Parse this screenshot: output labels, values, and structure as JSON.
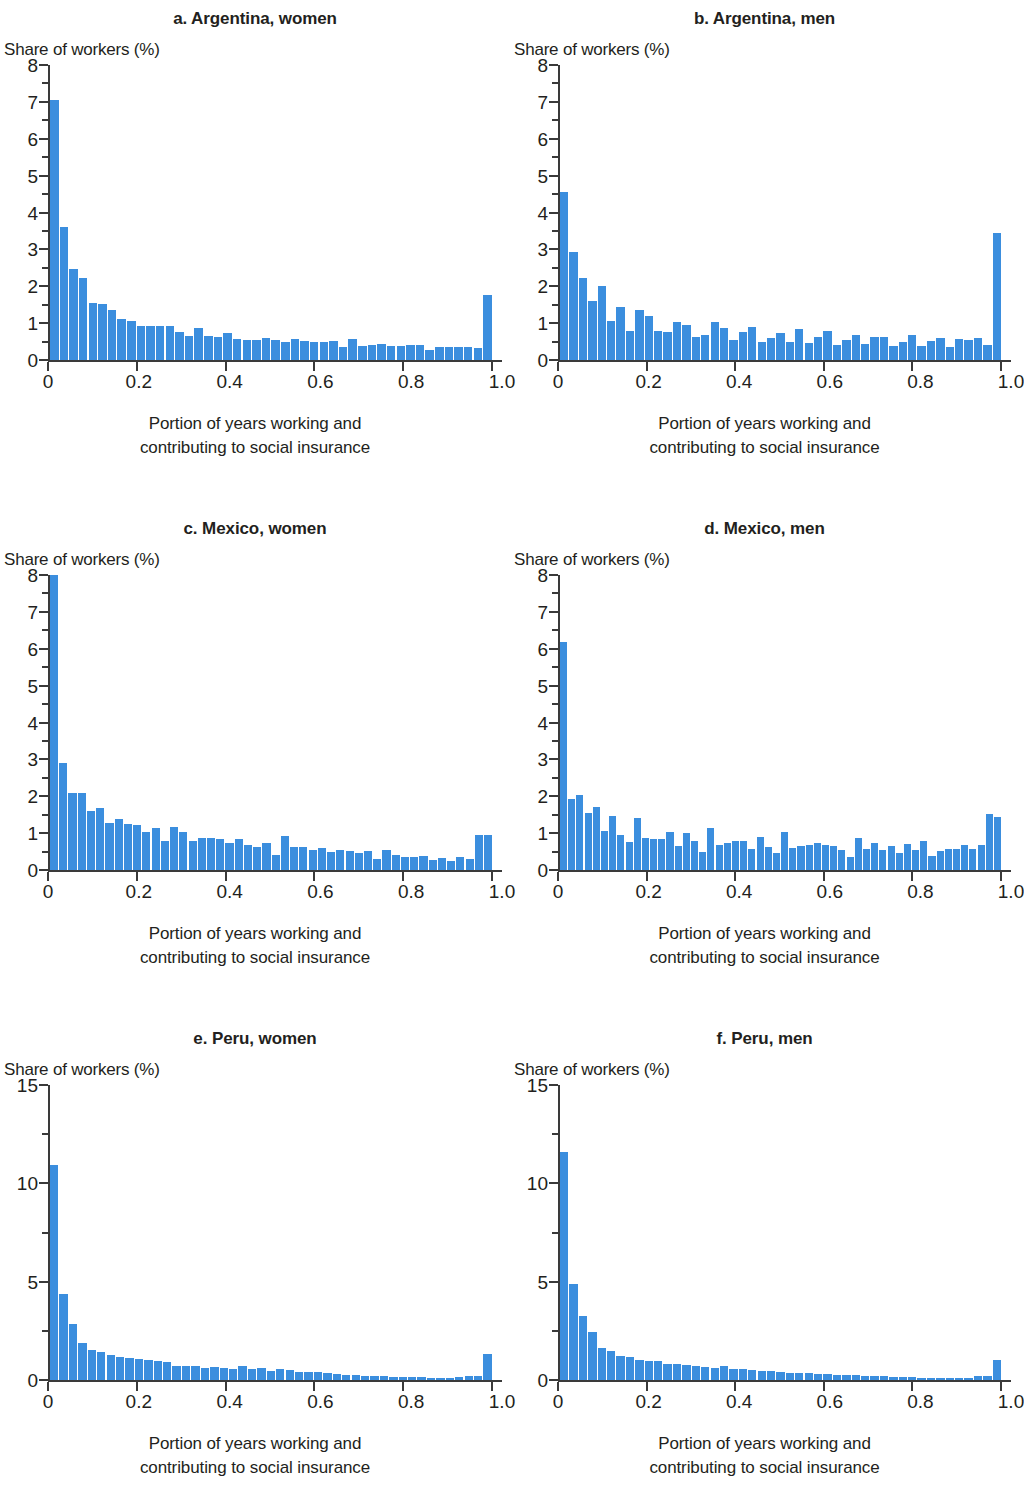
{
  "figure": {
    "ylabel": "Share of workers (%)",
    "xlabel_line1": "Portion of years working and",
    "xlabel_line2": "contributing to social insurance",
    "bar_color": "#3b8ede",
    "axis_color": "#3a3a3a",
    "text_color": "#231f20"
  },
  "chart_data": [
    {
      "type": "bar",
      "panel": "a",
      "title": "a. Argentina, women",
      "xlabel": "Portion of years working and contributing to social insurance",
      "ylabel": "Share of workers (%)",
      "ylim": [
        0,
        8
      ],
      "xlim": [
        0,
        1.0
      ],
      "yticks": [
        0,
        1,
        2,
        3,
        4,
        5,
        6,
        7,
        8
      ],
      "ytick_labels": [
        "0",
        "1",
        "2",
        "3",
        "4",
        "5",
        "6",
        "7",
        "8"
      ],
      "xticks": [
        0,
        0.2,
        0.4,
        0.6,
        0.8,
        1.0
      ],
      "xtick_labels": [
        "0",
        "0.2",
        "0.4",
        "0.6",
        "0.8",
        "1.0"
      ],
      "grid": false,
      "legend": "none",
      "values": [
        7.05,
        3.62,
        2.46,
        2.22,
        1.55,
        1.52,
        1.35,
        1.12,
        1.06,
        0.93,
        0.93,
        0.92,
        0.92,
        0.77,
        0.65,
        0.86,
        0.66,
        0.63,
        0.74,
        0.57,
        0.54,
        0.54,
        0.61,
        0.53,
        0.49,
        0.57,
        0.52,
        0.49,
        0.49,
        0.51,
        0.36,
        0.57,
        0.39,
        0.4,
        0.44,
        0.37,
        0.39,
        0.4,
        0.4,
        0.28,
        0.34,
        0.35,
        0.35,
        0.34,
        0.32,
        1.77
      ]
    },
    {
      "type": "bar",
      "panel": "b",
      "title": "b. Argentina, men",
      "xlabel": "Portion of years working and contributing to social insurance",
      "ylabel": "Share of workers (%)",
      "ylim": [
        0,
        8
      ],
      "xlim": [
        0,
        1.0
      ],
      "yticks": [
        0,
        1,
        2,
        3,
        4,
        5,
        6,
        7,
        8
      ],
      "ytick_labels": [
        "0",
        "1",
        "2",
        "3",
        "4",
        "5",
        "6",
        "7",
        "8"
      ],
      "xticks": [
        0,
        0.2,
        0.4,
        0.6,
        0.8,
        1.0
      ],
      "xtick_labels": [
        "0",
        "0.2",
        "0.4",
        "0.6",
        "0.8",
        "1.0"
      ],
      "grid": false,
      "legend": "none",
      "values": [
        4.55,
        2.94,
        2.22,
        1.6,
        2.0,
        1.05,
        1.43,
        0.8,
        1.35,
        1.2,
        0.78,
        0.75,
        1.03,
        0.96,
        0.63,
        0.68,
        1.03,
        0.86,
        0.55,
        0.75,
        0.9,
        0.5,
        0.6,
        0.72,
        0.5,
        0.84,
        0.46,
        0.62,
        0.78,
        0.4,
        0.55,
        0.67,
        0.43,
        0.62,
        0.63,
        0.38,
        0.48,
        0.67,
        0.38,
        0.52,
        0.6,
        0.36,
        0.58,
        0.55,
        0.6,
        0.42,
        3.45
      ]
    },
    {
      "type": "bar",
      "panel": "c",
      "title": "c. Mexico, women",
      "xlabel": "Portion of years working and contributing to social insurance",
      "ylabel": "Share of workers (%)",
      "ylim": [
        0,
        8
      ],
      "xlim": [
        0,
        1.0
      ],
      "yticks": [
        0,
        1,
        2,
        3,
        4,
        5,
        6,
        7,
        8
      ],
      "ytick_labels": [
        "0",
        "1",
        "2",
        "3",
        "4",
        "5",
        "6",
        "7",
        "8"
      ],
      "xticks": [
        0,
        0.2,
        0.4,
        0.6,
        0.8,
        1.0
      ],
      "xtick_labels": [
        "0",
        "0.2",
        "0.4",
        "0.6",
        "0.8",
        "1.0"
      ],
      "grid": false,
      "legend": "none",
      "values": [
        8.0,
        2.9,
        2.1,
        2.1,
        1.6,
        1.68,
        1.28,
        1.37,
        1.25,
        1.22,
        1.02,
        1.13,
        0.8,
        1.18,
        1.04,
        0.78,
        0.86,
        0.86,
        0.84,
        0.73,
        0.85,
        0.67,
        0.62,
        0.72,
        0.41,
        0.93,
        0.63,
        0.62,
        0.55,
        0.61,
        0.48,
        0.55,
        0.52,
        0.45,
        0.52,
        0.3,
        0.54,
        0.42,
        0.35,
        0.36,
        0.37,
        0.28,
        0.33,
        0.25,
        0.34,
        0.29,
        0.95,
        0.95
      ]
    },
    {
      "type": "bar",
      "panel": "d",
      "title": "d. Mexico, men",
      "xlabel": "Portion of years working and contributing to social insurance",
      "ylabel": "Share of workers (%)",
      "ylim": [
        0,
        8
      ],
      "xlim": [
        0,
        1.0
      ],
      "yticks": [
        0,
        1,
        2,
        3,
        4,
        5,
        6,
        7,
        8
      ],
      "ytick_labels": [
        "0",
        "1",
        "2",
        "3",
        "4",
        "5",
        "6",
        "7",
        "8"
      ],
      "xticks": [
        0,
        0.2,
        0.4,
        0.6,
        0.8,
        1.0
      ],
      "xtick_labels": [
        "0",
        "0.2",
        "0.4",
        "0.6",
        "0.8",
        "1.0"
      ],
      "grid": false,
      "legend": "none",
      "values": [
        6.18,
        1.92,
        2.03,
        1.55,
        1.72,
        1.06,
        1.46,
        0.95,
        0.76,
        1.4,
        0.86,
        0.83,
        0.85,
        1.04,
        0.66,
        1.0,
        0.78,
        0.5,
        1.15,
        0.69,
        0.74,
        0.78,
        0.8,
        0.57,
        0.89,
        0.62,
        0.46,
        1.02,
        0.6,
        0.66,
        0.68,
        0.72,
        0.67,
        0.64,
        0.54,
        0.36,
        0.88,
        0.56,
        0.74,
        0.53,
        0.65,
        0.45,
        0.7,
        0.54,
        0.79,
        0.38,
        0.51,
        0.57,
        0.58,
        0.67,
        0.56,
        0.68,
        1.51,
        1.45
      ]
    },
    {
      "type": "bar",
      "panel": "e",
      "title": "e. Peru, women",
      "xlabel": "Portion of years working and contributing to social insurance",
      "ylabel": "Share of workers (%)",
      "ylim": [
        0,
        15
      ],
      "xlim": [
        0,
        1.0
      ],
      "yticks": [
        0,
        5,
        10,
        15
      ],
      "ytick_labels": [
        "0",
        "5",
        "10",
        "15"
      ],
      "xticks": [
        0,
        0.2,
        0.4,
        0.6,
        0.8,
        1.0
      ],
      "xtick_labels": [
        "0",
        "0.2",
        "0.4",
        "0.6",
        "0.8",
        "1.0"
      ],
      "grid": false,
      "legend": "none",
      "values": [
        10.95,
        4.35,
        2.85,
        1.9,
        1.55,
        1.4,
        1.25,
        1.15,
        1.1,
        1.08,
        1.0,
        0.95,
        0.92,
        0.7,
        0.72,
        0.7,
        0.62,
        0.64,
        0.62,
        0.58,
        0.7,
        0.55,
        0.62,
        0.48,
        0.55,
        0.52,
        0.42,
        0.4,
        0.4,
        0.35,
        0.33,
        0.28,
        0.25,
        0.22,
        0.2,
        0.18,
        0.17,
        0.15,
        0.14,
        0.13,
        0.12,
        0.12,
        0.12,
        0.15,
        0.22,
        0.2,
        1.32
      ]
    },
    {
      "type": "bar",
      "panel": "f",
      "title": "f. Peru, men",
      "xlabel": "Portion of years working and contributing to social insurance",
      "ylabel": "Share of workers (%)",
      "ylim": [
        0,
        15
      ],
      "xlim": [
        0,
        1.0
      ],
      "yticks": [
        0,
        5,
        10,
        15
      ],
      "ytick_labels": [
        "0",
        "5",
        "10",
        "15"
      ],
      "xticks": [
        0,
        0.2,
        0.4,
        0.6,
        0.8,
        1.0
      ],
      "xtick_labels": [
        "0",
        "0.2",
        "0.4",
        "0.6",
        "0.8",
        "1.0"
      ],
      "grid": false,
      "legend": "none",
      "values": [
        11.6,
        4.9,
        3.25,
        2.45,
        1.65,
        1.48,
        1.22,
        1.15,
        1.0,
        0.98,
        0.96,
        0.8,
        0.82,
        0.75,
        0.72,
        0.68,
        0.62,
        0.7,
        0.55,
        0.55,
        0.52,
        0.48,
        0.45,
        0.42,
        0.38,
        0.38,
        0.36,
        0.32,
        0.3,
        0.28,
        0.28,
        0.25,
        0.22,
        0.2,
        0.18,
        0.16,
        0.15,
        0.14,
        0.12,
        0.11,
        0.1,
        0.1,
        0.1,
        0.12,
        0.18,
        0.22,
        1.02
      ]
    }
  ]
}
